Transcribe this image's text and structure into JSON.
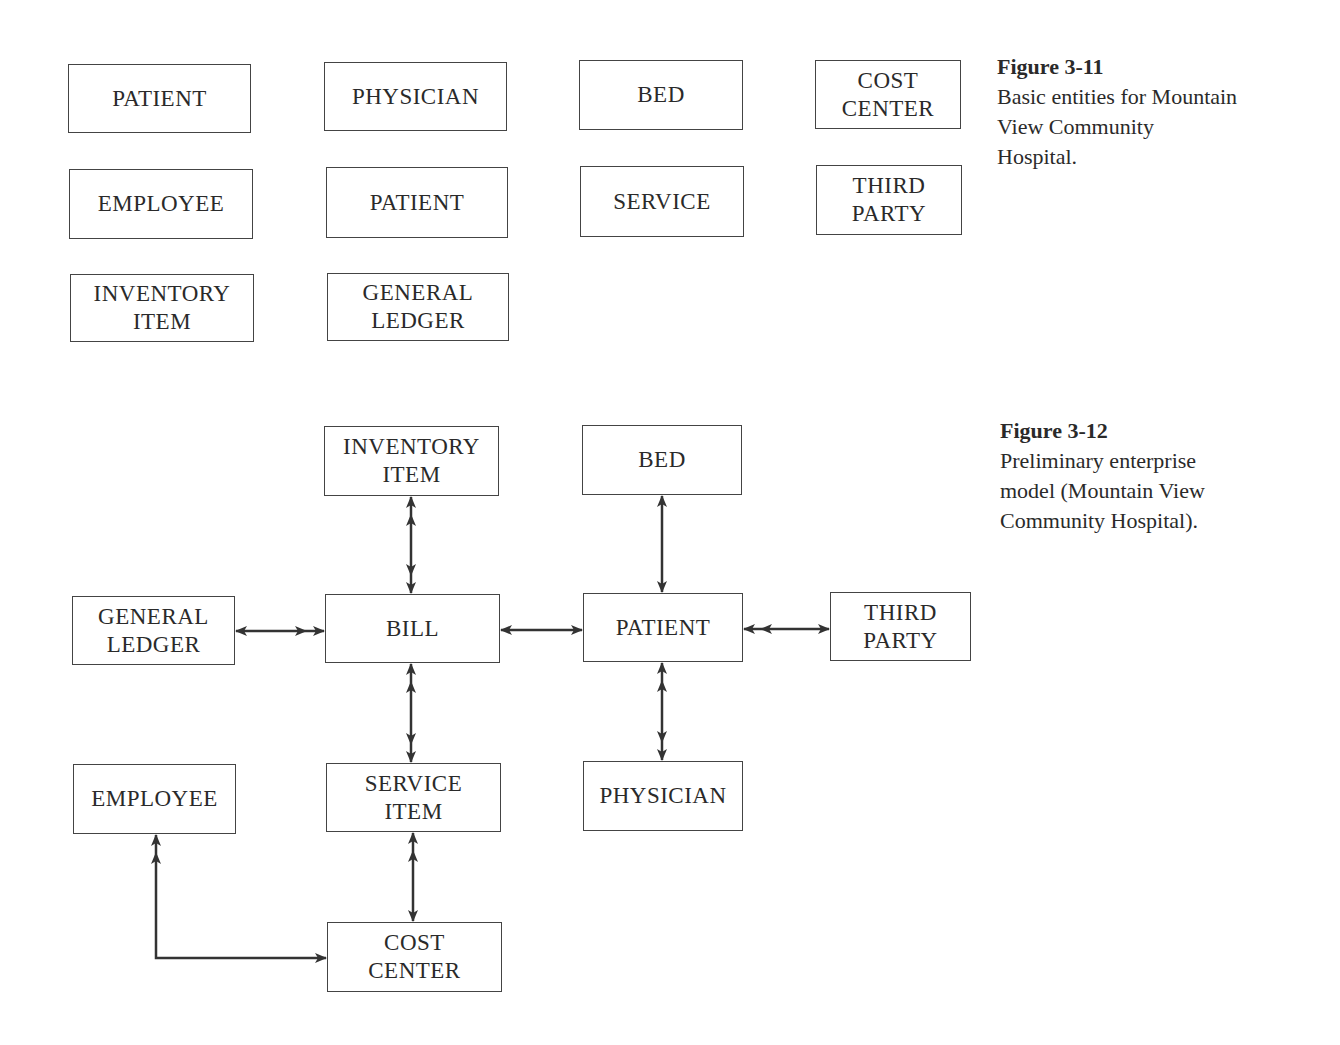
{
  "figure_3_11": {
    "label": "Figure 3-11",
    "caption": "Basic entities for Mountain\nView Community\nHospital.",
    "entities": [
      {
        "id": "patient",
        "label": "PATIENT",
        "x": 68,
        "y": 64,
        "w": 183,
        "h": 69
      },
      {
        "id": "physician",
        "label": "PHYSICIAN",
        "x": 324,
        "y": 62,
        "w": 183,
        "h": 69
      },
      {
        "id": "bed",
        "label": "BED",
        "x": 579,
        "y": 60,
        "w": 164,
        "h": 70
      },
      {
        "id": "cost-center",
        "label": "COST\nCENTER",
        "x": 815,
        "y": 60,
        "w": 146,
        "h": 69
      },
      {
        "id": "employee",
        "label": "EMPLOYEE",
        "x": 69,
        "y": 169,
        "w": 184,
        "h": 70
      },
      {
        "id": "patient-2",
        "label": "PATIENT",
        "x": 326,
        "y": 167,
        "w": 182,
        "h": 71
      },
      {
        "id": "service",
        "label": "SERVICE",
        "x": 580,
        "y": 166,
        "w": 164,
        "h": 71
      },
      {
        "id": "third-party",
        "label": "THIRD\nPARTY",
        "x": 816,
        "y": 165,
        "w": 146,
        "h": 70
      },
      {
        "id": "inventory-item",
        "label": "INVENTORY\nITEM",
        "x": 70,
        "y": 274,
        "w": 184,
        "h": 68
      },
      {
        "id": "general-ledger",
        "label": "GENERAL\nLEDGER",
        "x": 327,
        "y": 273,
        "w": 182,
        "h": 68
      }
    ]
  },
  "figure_3_12": {
    "label": "Figure 3-12",
    "caption": "Preliminary enterprise\nmodel (Mountain View\nCommunity Hospital).",
    "entities": [
      {
        "id": "inventory-item",
        "label": "INVENTORY\nITEM",
        "x": 324,
        "y": 426,
        "w": 175,
        "h": 70
      },
      {
        "id": "bed",
        "label": "BED",
        "x": 582,
        "y": 425,
        "w": 160,
        "h": 70
      },
      {
        "id": "general-ledger",
        "label": "GENERAL\nLEDGER",
        "x": 72,
        "y": 596,
        "w": 163,
        "h": 69
      },
      {
        "id": "bill",
        "label": "BILL",
        "x": 325,
        "y": 594,
        "w": 175,
        "h": 69
      },
      {
        "id": "patient",
        "label": "PATIENT",
        "x": 583,
        "y": 593,
        "w": 160,
        "h": 69
      },
      {
        "id": "third-party",
        "label": "THIRD\nPARTY",
        "x": 830,
        "y": 592,
        "w": 141,
        "h": 69
      },
      {
        "id": "employee",
        "label": "EMPLOYEE",
        "x": 73,
        "y": 764,
        "w": 163,
        "h": 70
      },
      {
        "id": "service-item",
        "label": "SERVICE\nITEM",
        "x": 326,
        "y": 763,
        "w": 175,
        "h": 69
      },
      {
        "id": "physician",
        "label": "PHYSICIAN",
        "x": 583,
        "y": 761,
        "w": 160,
        "h": 70
      },
      {
        "id": "cost-center",
        "label": "COST\nCENTER",
        "x": 327,
        "y": 922,
        "w": 175,
        "h": 70
      }
    ],
    "relationships": [
      {
        "from": "inventory-item",
        "to": "bill",
        "from_end": "many",
        "to_end": "many"
      },
      {
        "from": "general-ledger",
        "to": "bill",
        "from_end": "one",
        "to_end": "many"
      },
      {
        "from": "bill",
        "to": "patient",
        "from_end": "one",
        "to_end": "one"
      },
      {
        "from": "bed",
        "to": "patient",
        "from_end": "one",
        "to_end": "one"
      },
      {
        "from": "patient",
        "to": "third-party",
        "from_end": "many",
        "to_end": "one"
      },
      {
        "from": "bill",
        "to": "service-item",
        "from_end": "many",
        "to_end": "many"
      },
      {
        "from": "patient",
        "to": "physician",
        "from_end": "many",
        "to_end": "many"
      },
      {
        "from": "service-item",
        "to": "cost-center",
        "from_end": "many",
        "to_end": "one"
      },
      {
        "from": "employee",
        "to": "cost-center",
        "from_end": "many",
        "to_end": "one"
      }
    ]
  }
}
